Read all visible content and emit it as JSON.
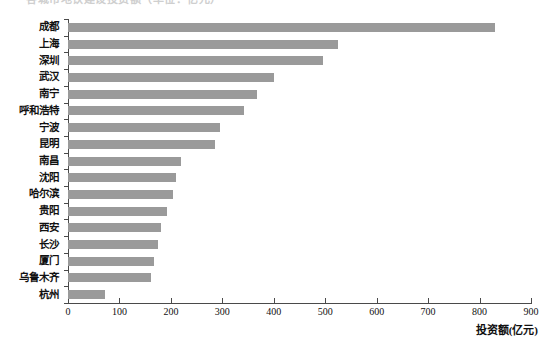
{
  "title": {
    "text": "各城市地铁建设投资额（单位：亿元）",
    "visible_partial": true
  },
  "axis": {
    "x_title": "投资额(亿元)",
    "x_ticks": [
      "0",
      "100",
      "200",
      "300",
      "400",
      "500",
      "600",
      "700",
      "800",
      "900"
    ]
  },
  "colors": {
    "bar": "#9a9a9a",
    "axis": "#4a4a4a",
    "text": "#111111",
    "background": "#ffffff"
  },
  "chart_data": {
    "type": "bar",
    "orientation": "horizontal",
    "title": "各城市地铁建设投资额（单位：亿元）",
    "xlabel": "投资额(亿元)",
    "ylabel": "",
    "xlim": [
      0,
      900
    ],
    "xticks": [
      0,
      100,
      200,
      300,
      400,
      500,
      600,
      700,
      800,
      900
    ],
    "grid": false,
    "legend": false,
    "categories": [
      "成都",
      "上海",
      "深圳",
      "武汉",
      "南宁",
      "呼和浩特",
      "宁波",
      "昆明",
      "南昌",
      "沈阳",
      "哈尔滨",
      "贵阳",
      "西安",
      "长沙",
      "厦门",
      "乌鲁木齐",
      "杭州"
    ],
    "values": [
      830,
      525,
      495,
      400,
      368,
      342,
      295,
      285,
      220,
      210,
      205,
      193,
      180,
      175,
      168,
      162,
      72
    ]
  }
}
